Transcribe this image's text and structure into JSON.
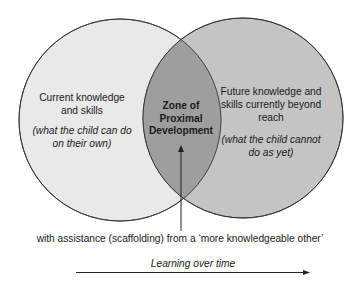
{
  "diagram": {
    "title": "Zone of Proximal Development",
    "colors": {
      "left_circle_fill": "#e9e9e9",
      "right_circle_fill": "#c4c4c4",
      "overlap_fill": "#9e9e9e",
      "stroke": "#333333",
      "background": "#ffffff"
    },
    "left_circle": {
      "label": "Current knowledge",
      "label_line2": "and skills",
      "note_line1": "(what the child can do",
      "note_line2": "on their own)"
    },
    "right_circle": {
      "label_line1": "Future knowledge and",
      "label_line2": "skills currently beyond",
      "label_line3": "reach",
      "note_line1": "(what the child cannot",
      "note_line2": "do as yet)"
    },
    "overlap": {
      "line1": "Zone of",
      "line2": "Proximal",
      "line3": "Development"
    },
    "caption": "with assistance (scaffolding) from a ‘more knowledgeable other’",
    "timeline_label": "Learning over time"
  }
}
